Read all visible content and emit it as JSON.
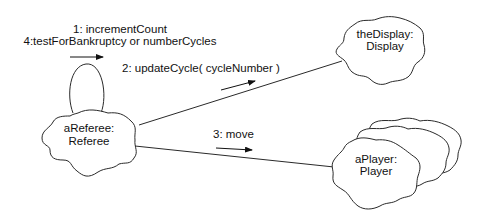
{
  "diagram": {
    "type": "uml-collaboration-diagram",
    "objects": [
      {
        "id": "referee",
        "name": "aReferee:",
        "class": "Referee"
      },
      {
        "id": "display",
        "name": "theDisplay:",
        "class": "Display"
      },
      {
        "id": "player",
        "name": "aPlayer:",
        "class": "Player",
        "multiobject": true
      }
    ],
    "messages": [
      {
        "id": "m1",
        "label": "1: incrementCount",
        "from": "referee",
        "to": "referee"
      },
      {
        "id": "m4",
        "label": "4:testForBankruptcy or numberCycles",
        "from": "referee",
        "to": "referee"
      },
      {
        "id": "m2",
        "label": "2: updateCycle( cycleNumber )",
        "from": "referee",
        "to": "display"
      },
      {
        "id": "m3",
        "label": "3: move",
        "from": "referee",
        "to": "player"
      }
    ],
    "links": [
      {
        "from": "referee",
        "to": "referee",
        "kind": "self-loop"
      },
      {
        "from": "referee",
        "to": "display"
      },
      {
        "from": "referee",
        "to": "player"
      }
    ]
  }
}
